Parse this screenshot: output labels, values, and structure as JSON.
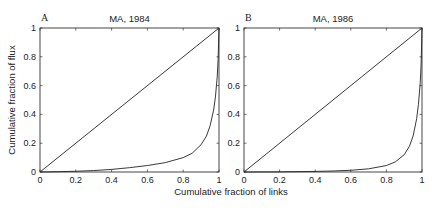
{
  "chart_data": [
    {
      "type": "line",
      "panel": "A",
      "title": "MA, 1984",
      "xlabel": "Cumulative fraction of links",
      "ylabel": "Cumulative fraction of flux",
      "xlim": [
        0,
        1
      ],
      "ylim": [
        0,
        1
      ],
      "xticks": [
        "0",
        "0.2",
        "0.4",
        "0.6",
        "0.8",
        "1"
      ],
      "yticks": [
        "0",
        "0.2",
        "0.4",
        "0.6",
        "0.8",
        "1"
      ],
      "grid": false,
      "series": [
        {
          "name": "equality line",
          "x": [
            0,
            1
          ],
          "y": [
            0,
            1
          ]
        },
        {
          "name": "cumulative flux",
          "x": [
            0,
            0.1,
            0.2,
            0.3,
            0.4,
            0.5,
            0.6,
            0.7,
            0.8,
            0.85,
            0.9,
            0.93,
            0.95,
            0.97,
            0.98,
            0.99,
            0.995,
            1.0
          ],
          "y": [
            0,
            0.002,
            0.005,
            0.01,
            0.018,
            0.03,
            0.045,
            0.065,
            0.1,
            0.13,
            0.19,
            0.25,
            0.32,
            0.43,
            0.52,
            0.66,
            0.78,
            1.0
          ]
        }
      ]
    },
    {
      "type": "line",
      "panel": "B",
      "title": "MA, 1986",
      "xlabel": "Cumulative fraction of links",
      "ylabel": "",
      "xlim": [
        0,
        1
      ],
      "ylim": [
        0,
        1
      ],
      "xticks": [
        "0",
        "0.2",
        "0.4",
        "0.6",
        "0.8",
        "1"
      ],
      "yticks": [
        "0",
        "0.2",
        "0.4",
        "0.6",
        "0.8",
        "1"
      ],
      "grid": false,
      "series": [
        {
          "name": "equality line",
          "x": [
            0,
            1
          ],
          "y": [
            0,
            1
          ]
        },
        {
          "name": "cumulative flux",
          "x": [
            0,
            0.2,
            0.4,
            0.5,
            0.6,
            0.7,
            0.8,
            0.85,
            0.9,
            0.93,
            0.95,
            0.97,
            0.98,
            0.99,
            0.995,
            1.0
          ],
          "y": [
            0,
            0.001,
            0.004,
            0.007,
            0.012,
            0.022,
            0.045,
            0.07,
            0.12,
            0.18,
            0.25,
            0.37,
            0.47,
            0.62,
            0.75,
            1.0
          ]
        }
      ]
    }
  ],
  "shared": {
    "xlabel": "Cumulative fraction of links",
    "ylabel": "Cumulative fraction of flux"
  }
}
